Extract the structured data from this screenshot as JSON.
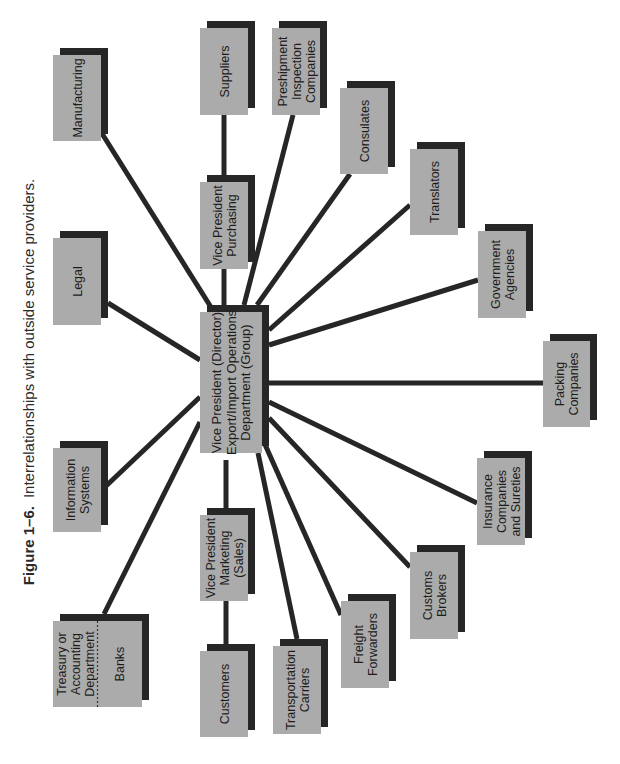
{
  "caption": {
    "number": "Figure 1–6.",
    "text": "Interrelationships with outside service providers."
  },
  "colors": {
    "box_fill": "#ababab",
    "shadow": "#262626",
    "line": "#262626",
    "text": "#1c1c1c",
    "background": "#ffffff"
  },
  "center": {
    "id": "center",
    "lines": [
      "Vice President (Director)",
      "Export/Import Operations",
      "Department (Group)"
    ],
    "x": 200,
    "y": 312,
    "w": 62,
    "h": 141
  },
  "nodes": [
    {
      "id": "manufacturing",
      "lines": [
        "Manufacturing"
      ],
      "x": 53,
      "y": 55,
      "w": 48,
      "h": 86,
      "attach": [
        101,
        132
      ],
      "to": [
        214,
        312
      ]
    },
    {
      "id": "suppliers",
      "lines": [
        "Suppliers"
      ],
      "x": 200,
      "y": 28,
      "w": 48,
      "h": 87,
      "attach": [
        224,
        115
      ],
      "to": [
        224,
        182
      ]
    },
    {
      "id": "preshipment-inspection-companies",
      "lines": [
        "Preshipment",
        "Inspection",
        "Companies"
      ],
      "x": 272,
      "y": 28,
      "w": 48,
      "h": 87,
      "attach": [
        293,
        115
      ],
      "to": [
        244,
        305
      ]
    },
    {
      "id": "consulates",
      "lines": [
        "Consulates"
      ],
      "x": 340,
      "y": 88,
      "w": 48,
      "h": 86,
      "attach": [
        350,
        174
      ],
      "to": [
        257,
        305
      ]
    },
    {
      "id": "translators",
      "lines": [
        "Translators"
      ],
      "x": 410,
      "y": 149,
      "w": 48,
      "h": 86,
      "attach": [
        410,
        205
      ],
      "to": [
        269,
        330
      ]
    },
    {
      "id": "legal",
      "lines": [
        "Legal"
      ],
      "x": 53,
      "y": 238,
      "w": 48,
      "h": 87,
      "attach": [
        108,
        303
      ],
      "to": [
        200,
        360
      ]
    },
    {
      "id": "vp-purchasing",
      "lines": [
        "Vice President",
        "Purchasing"
      ],
      "x": 200,
      "y": 182,
      "w": 48,
      "h": 87,
      "attach": [
        224,
        269
      ],
      "to": [
        224,
        305
      ]
    },
    {
      "id": "government-agencies",
      "lines": [
        "Government",
        "Agencies"
      ],
      "x": 478,
      "y": 231,
      "w": 48,
      "h": 87,
      "attach": [
        478,
        280
      ],
      "to": [
        269,
        345
      ]
    },
    {
      "id": "packing-companies",
      "lines": [
        "Packing",
        "Companies"
      ],
      "x": 543,
      "y": 341,
      "w": 47,
      "h": 86,
      "attach": [
        543,
        383
      ],
      "to": [
        269,
        383
      ]
    },
    {
      "id": "information-systems",
      "lines": [
        "Information",
        "Systems"
      ],
      "x": 53,
      "y": 448,
      "w": 48,
      "h": 84,
      "attach": [
        106,
        486
      ],
      "to": [
        200,
        397
      ]
    },
    {
      "id": "insurance-companies-sureties",
      "lines": [
        "Insurance",
        "Companies",
        "and Sureties"
      ],
      "x": 477,
      "y": 458,
      "w": 48,
      "h": 87,
      "attach": [
        477,
        503
      ],
      "to": [
        269,
        402
      ]
    },
    {
      "id": "vp-marketing",
      "lines": [
        "Vice President",
        "Marketing",
        "(Sales)"
      ],
      "x": 200,
      "y": 515,
      "w": 48,
      "h": 86,
      "attach": [
        226,
        508
      ],
      "to": [
        226,
        460
      ]
    },
    {
      "id": "customs-brokers",
      "lines": [
        "Customs",
        "Brokers"
      ],
      "x": 410,
      "y": 552,
      "w": 48,
      "h": 87,
      "attach": [
        410,
        567
      ],
      "to": [
        269,
        418
      ]
    },
    {
      "id": "freight-forwarders",
      "lines": [
        "Freight",
        "Forwarders"
      ],
      "x": 341,
      "y": 601,
      "w": 48,
      "h": 87,
      "attach": [
        341,
        615
      ],
      "to": [
        263,
        440
      ]
    },
    {
      "id": "treasury-banks",
      "lines": [
        "Treasury or",
        "Accounting",
        "Department"
      ],
      "split_label": "Banks",
      "x": 53,
      "y": 621,
      "w": 89,
      "h": 86,
      "attach": [
        104,
        614
      ],
      "to": [
        200,
        422
      ]
    },
    {
      "id": "customers",
      "lines": [
        "Customers"
      ],
      "x": 200,
      "y": 651,
      "w": 48,
      "h": 86,
      "attach": [
        226,
        644
      ],
      "to": [
        226,
        601
      ]
    },
    {
      "id": "transportation-carriers",
      "lines": [
        "Transportation",
        "Carriers"
      ],
      "x": 273,
      "y": 646,
      "w": 48,
      "h": 88,
      "attach": [
        297,
        639
      ],
      "to": [
        258,
        453
      ]
    }
  ]
}
